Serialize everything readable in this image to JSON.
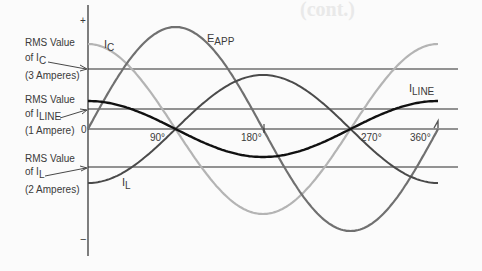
{
  "background_text": {
    "heading": "(cont.)"
  },
  "axis": {
    "plus_label": "+",
    "minus_label": "−",
    "zero_label": "0",
    "degree_ticks": [
      "90°",
      "180°",
      "270°",
      "360°"
    ]
  },
  "annotations": {
    "ic_rms": {
      "line1": "RMS Value",
      "line2_prefix": "of I",
      "line2_sub": "C",
      "line3": "(3 Amperes)"
    },
    "iline_rms": {
      "line1": "RMS Value",
      "line2_prefix": "of I",
      "line2_sub": "LINE",
      "line3": "(1 Ampere)"
    },
    "il_rms": {
      "line1": "RMS Value",
      "line2_prefix": "of I",
      "line2_sub": "L",
      "line3": "(2 Amperes)"
    }
  },
  "curve_labels": {
    "ic": {
      "main": "I",
      "sub": "C"
    },
    "eapp": {
      "main": "E",
      "sub": "APP"
    },
    "iline": {
      "main": "I",
      "sub": "LINE"
    },
    "il": {
      "main": "I",
      "sub": "L"
    }
  },
  "colors": {
    "eapp": "#707070",
    "ic": "#b4b4b4",
    "il": "#4a4a4a",
    "iline": "#111111",
    "gridline": "#2a2a2a",
    "text": "#3a3a3a"
  },
  "chart_data": {
    "type": "line",
    "title": "",
    "xlabel": "Phase angle (degrees)",
    "ylabel": "Instantaneous value",
    "x": [
      0,
      90,
      180,
      270,
      360
    ],
    "x_tick_labels": [
      "0",
      "90°",
      "180°",
      "270°",
      "360°"
    ],
    "series": [
      {
        "name": "E_APP",
        "shape": "sine",
        "values": [
          0,
          1,
          0,
          -1,
          0
        ]
      },
      {
        "name": "I_C",
        "shape": "cosine (leads E by 90°)",
        "values": [
          4.24,
          0,
          -4.24,
          0,
          4.24
        ]
      },
      {
        "name": "I_L",
        "shape": "-cosine (lags E by 90°)",
        "values": [
          -2.83,
          0,
          2.83,
          0,
          -2.83
        ]
      },
      {
        "name": "I_LINE",
        "shape": "cosine (I_C - I_L)",
        "values": [
          1.41,
          0,
          -1.41,
          0,
          1.41
        ]
      }
    ],
    "rms_reference_lines": [
      {
        "name": "RMS Value of I_C",
        "value": 3,
        "unit": "Amperes"
      },
      {
        "name": "RMS Value of I_LINE",
        "value": 1,
        "unit": "Ampere"
      },
      {
        "name": "RMS Value of I_L",
        "value": 2,
        "unit": "Amperes"
      }
    ],
    "grid": false,
    "legend": "inline labels"
  }
}
